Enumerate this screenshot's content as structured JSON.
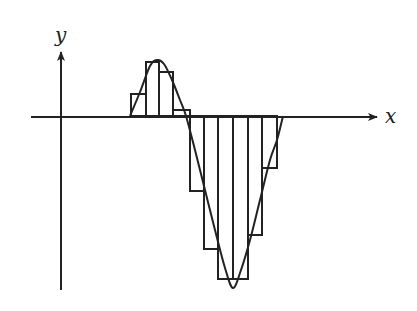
{
  "diagram": {
    "title": "",
    "axes": {
      "x_label": "x",
      "y_label": "y",
      "color": "#222222"
    },
    "stroke_color": "#222222",
    "curve": {
      "name": "function-curve",
      "points": [
        [
          130,
          116
        ],
        [
          140,
          92
        ],
        [
          150,
          66
        ],
        [
          157,
          60
        ],
        [
          164,
          64
        ],
        [
          172,
          80
        ],
        [
          180,
          100
        ],
        [
          186,
          116
        ],
        [
          195,
          150
        ],
        [
          205,
          190
        ],
        [
          215,
          230
        ],
        [
          225,
          268
        ],
        [
          233,
          288
        ],
        [
          241,
          270
        ],
        [
          250,
          240
        ],
        [
          260,
          200
        ],
        [
          270,
          160
        ],
        [
          277,
          140
        ],
        [
          283,
          116
        ]
      ]
    },
    "rectangles": [
      {
        "x0": 131,
        "x1": 146,
        "top": 94,
        "bottom": 116
      },
      {
        "x0": 146,
        "x1": 159,
        "top": 62,
        "bottom": 116
      },
      {
        "x0": 159,
        "x1": 173,
        "top": 72,
        "bottom": 116
      },
      {
        "x0": 173,
        "x1": 190,
        "top": 110,
        "bottom": 116
      },
      {
        "x0": 190,
        "x1": 204,
        "top": 116,
        "bottom": 191
      },
      {
        "x0": 204,
        "x1": 218,
        "top": 116,
        "bottom": 249
      },
      {
        "x0": 218,
        "x1": 233,
        "top": 116,
        "bottom": 279
      },
      {
        "x0": 233,
        "x1": 248,
        "top": 116,
        "bottom": 279
      },
      {
        "x0": 248,
        "x1": 262,
        "top": 116,
        "bottom": 235
      },
      {
        "x0": 262,
        "x1": 277,
        "top": 116,
        "bottom": 168
      }
    ]
  }
}
